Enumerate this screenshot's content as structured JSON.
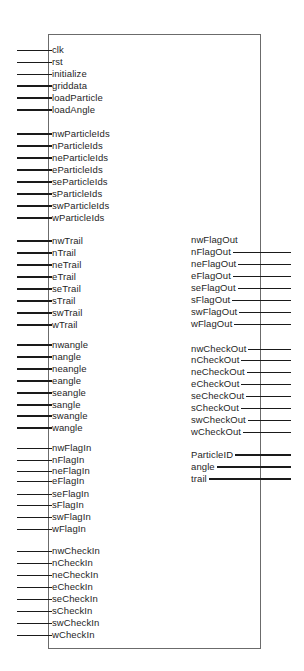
{
  "module": {
    "box": {
      "left": 48,
      "top": 34,
      "right": 261,
      "bottom": 649,
      "border_color": "#6b6b6b"
    },
    "wire_color": "#1a1a1a",
    "inputs": [
      {
        "name": "clk",
        "y": 50,
        "bus": false
      },
      {
        "name": "rst",
        "y": 62,
        "bus": false
      },
      {
        "name": "initialize",
        "y": 74,
        "bus": false
      },
      {
        "name": "griddata",
        "y": 86,
        "bus": true
      },
      {
        "name": "loadParticle",
        "y": 98,
        "bus": true
      },
      {
        "name": "loadAngle",
        "y": 110,
        "bus": true
      },
      {
        "name": "nwParticleIds",
        "y": 134,
        "bus": true
      },
      {
        "name": "nParticleIds",
        "y": 146,
        "bus": true
      },
      {
        "name": "neParticleIds",
        "y": 158,
        "bus": true
      },
      {
        "name": "eParticleIds",
        "y": 170,
        "bus": true
      },
      {
        "name": "seParticleIds",
        "y": 182,
        "bus": true
      },
      {
        "name": "sParticleIds",
        "y": 194,
        "bus": true
      },
      {
        "name": "swParticleIds",
        "y": 206,
        "bus": true
      },
      {
        "name": "wParticleIds",
        "y": 218,
        "bus": true
      },
      {
        "name": "nwTrail",
        "y": 241,
        "bus": true
      },
      {
        "name": "nTrail",
        "y": 253,
        "bus": true
      },
      {
        "name": "neTrail",
        "y": 265,
        "bus": true
      },
      {
        "name": "eTrail",
        "y": 277,
        "bus": true
      },
      {
        "name": "seTrail",
        "y": 289,
        "bus": true
      },
      {
        "name": "sTrail",
        "y": 301,
        "bus": true
      },
      {
        "name": "swTrail",
        "y": 313,
        "bus": true
      },
      {
        "name": "wTrail",
        "y": 325,
        "bus": true
      },
      {
        "name": "nwangle",
        "y": 345,
        "bus": true
      },
      {
        "name": "nangle",
        "y": 357,
        "bus": true
      },
      {
        "name": "neangle",
        "y": 369,
        "bus": true
      },
      {
        "name": "eangle",
        "y": 381,
        "bus": true
      },
      {
        "name": "seangle",
        "y": 393,
        "bus": true
      },
      {
        "name": "sangle",
        "y": 405,
        "bus": true
      },
      {
        "name": "swangle",
        "y": 416,
        "bus": true
      },
      {
        "name": "wangle",
        "y": 428,
        "bus": true
      },
      {
        "name": "nwFlagIn",
        "y": 448,
        "bus": false
      },
      {
        "name": "nFlagIn",
        "y": 460,
        "bus": false
      },
      {
        "name": "neFlagIn",
        "y": 471,
        "bus": false
      },
      {
        "name": "eFlagIn",
        "y": 481,
        "bus": false
      },
      {
        "name": "seFlagIn",
        "y": 494,
        "bus": false
      },
      {
        "name": "sFlagIn",
        "y": 505,
        "bus": false
      },
      {
        "name": "swFlagIn",
        "y": 517,
        "bus": false
      },
      {
        "name": "wFlagIn",
        "y": 529,
        "bus": false
      },
      {
        "name": "nwCheckIn",
        "y": 551,
        "bus": false
      },
      {
        "name": "nCheckIn",
        "y": 563,
        "bus": false
      },
      {
        "name": "neCheckIn",
        "y": 575,
        "bus": false
      },
      {
        "name": "eCheckIn",
        "y": 587,
        "bus": false
      },
      {
        "name": "seCheckIn",
        "y": 599,
        "bus": false
      },
      {
        "name": "sCheckIn",
        "y": 611,
        "bus": false
      },
      {
        "name": "swCheckIn",
        "y": 623,
        "bus": false
      },
      {
        "name": "wCheckIn",
        "y": 635,
        "bus": false
      }
    ],
    "outputs": [
      {
        "name": "nwFlagOut",
        "y": 240,
        "bus": false,
        "wire": false
      },
      {
        "name": "nFlagOut",
        "y": 252,
        "bus": false,
        "wire": true
      },
      {
        "name": "neFlagOut",
        "y": 264,
        "bus": false,
        "wire": true
      },
      {
        "name": "eFlagOut",
        "y": 276,
        "bus": false,
        "wire": true
      },
      {
        "name": "seFlagOut",
        "y": 288,
        "bus": false,
        "wire": true
      },
      {
        "name": "sFlagOut",
        "y": 300,
        "bus": false,
        "wire": true
      },
      {
        "name": "swFlagOut",
        "y": 312,
        "bus": false,
        "wire": true
      },
      {
        "name": "wFlagOut",
        "y": 324,
        "bus": false,
        "wire": true
      },
      {
        "name": "nwCheckOut",
        "y": 349,
        "bus": false,
        "wire": true
      },
      {
        "name": "nCheckOut",
        "y": 360,
        "bus": false,
        "wire": true
      },
      {
        "name": "neCheckOut",
        "y": 372,
        "bus": false,
        "wire": true
      },
      {
        "name": "eCheckOut",
        "y": 384,
        "bus": false,
        "wire": true
      },
      {
        "name": "seCheckOut",
        "y": 396,
        "bus": false,
        "wire": true
      },
      {
        "name": "sCheckOut",
        "y": 408,
        "bus": false,
        "wire": true
      },
      {
        "name": "swCheckOut",
        "y": 420,
        "bus": false,
        "wire": true
      },
      {
        "name": "wCheckOut",
        "y": 432,
        "bus": false,
        "wire": true
      },
      {
        "name": "ParticleID",
        "y": 455,
        "bus": true,
        "wire": true
      },
      {
        "name": "angle",
        "y": 467,
        "bus": true,
        "wire": true
      },
      {
        "name": "trail",
        "y": 479,
        "bus": true,
        "wire": true
      }
    ]
  }
}
